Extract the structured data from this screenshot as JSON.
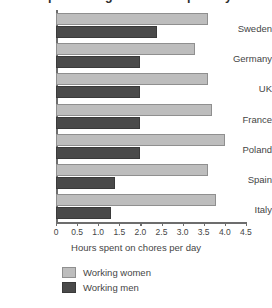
{
  "chart_data": {
    "type": "bar",
    "orientation": "horizontal",
    "title": "Time spent doing housework per day",
    "categories": [
      "Sweden",
      "Germany",
      "UK",
      "France",
      "Poland",
      "Spain",
      "Italy"
    ],
    "series": [
      {
        "name": "Working women",
        "color": "#bdbdbd",
        "values": [
          3.6,
          3.3,
          3.6,
          3.7,
          4.0,
          3.6,
          3.8
        ]
      },
      {
        "name": "Working men",
        "color": "#4a4a4a",
        "values": [
          2.4,
          2.0,
          2.0,
          2.0,
          2.0,
          1.4,
          1.3
        ]
      }
    ],
    "xlabel": "Hours spent on chores per day",
    "ylabel": "",
    "xlim": [
      0,
      4.5
    ],
    "xticks": [
      "0",
      "0.5",
      "1.0",
      "1.5",
      "2.0",
      "2.5",
      "3.0",
      "3.5",
      "4.0",
      "4.5"
    ],
    "xtick_values": [
      0,
      0.5,
      1.0,
      1.5,
      2.0,
      2.5,
      3.0,
      3.5,
      4.0,
      4.5
    ],
    "grid": false,
    "legend_position": "bottom-left"
  },
  "legend": {
    "items": [
      {
        "label": "Working women",
        "color": "#bdbdbd"
      },
      {
        "label": "Working men",
        "color": "#4a4a4a"
      }
    ]
  }
}
